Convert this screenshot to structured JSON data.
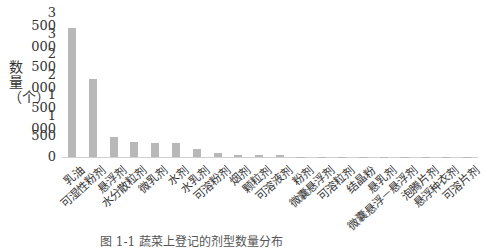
{
  "chart_data": {
    "type": "bar",
    "title": "",
    "xlabel": "",
    "ylabel": "数量（个）",
    "ylim": [
      0,
      3500
    ],
    "yticks": [
      "0",
      "500",
      "1 000",
      "1 500",
      "2 000",
      "2 500",
      "3 000",
      "3 500"
    ],
    "grid": false,
    "legend": null,
    "categories": [
      "乳油",
      "可湿性粉剂",
      "悬浮剂",
      "水分散粒剂",
      "微乳剂",
      "水剂",
      "水乳剂",
      "可溶粉剂",
      "烟剂",
      "颗粒剂",
      "可溶液剂",
      "粉剂",
      "微囊悬浮剂",
      "可溶粒剂",
      "结晶粉",
      "悬乳剂",
      "微囊悬浮－悬浮剂",
      "泡腾片剂",
      "悬浮种衣剂",
      "可溶片剂"
    ],
    "values": [
      3140,
      1900,
      490,
      360,
      350,
      340,
      200,
      100,
      60,
      50,
      45,
      5,
      5,
      3,
      2,
      2,
      2,
      1,
      1,
      1
    ]
  },
  "caption": "图 1-1  蔬菜上登记的剂型数量分布"
}
